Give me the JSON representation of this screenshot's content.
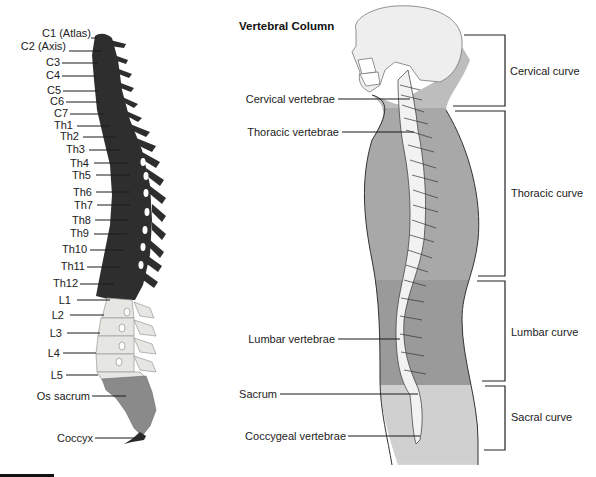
{
  "title": "Vertebral Column",
  "left_panel": {
    "labels": [
      {
        "text": "C1 (Atlas)",
        "y": 33,
        "right": 91
      },
      {
        "text": "C2 (Axis)",
        "y": 46,
        "right": 66
      },
      {
        "text": "C3",
        "y": 61,
        "right": 60
      },
      {
        "text": "C4",
        "y": 74,
        "right": 60
      },
      {
        "text": "C5",
        "y": 89,
        "right": 61
      },
      {
        "text": "C6",
        "y": 100,
        "right": 64
      },
      {
        "text": "C7",
        "y": 112,
        "right": 68
      },
      {
        "text": "Th1",
        "y": 124,
        "right": 73
      },
      {
        "text": "Th2",
        "y": 135,
        "right": 79
      },
      {
        "text": "Th3",
        "y": 148,
        "right": 85
      },
      {
        "text": "Th4",
        "y": 162,
        "right": 89
      },
      {
        "text": "Th5",
        "y": 175,
        "right": 91
      },
      {
        "text": "Th6",
        "y": 191,
        "right": 92
      },
      {
        "text": "Th7",
        "y": 204,
        "right": 93
      },
      {
        "text": "Th8",
        "y": 218,
        "right": 91
      },
      {
        "text": "Th9",
        "y": 232,
        "right": 89
      },
      {
        "text": "Th10",
        "y": 248,
        "right": 87
      },
      {
        "text": "Th11",
        "y": 265,
        "right": 85
      },
      {
        "text": "Th12",
        "y": 282,
        "right": 79
      },
      {
        "text": "L1",
        "y": 298,
        "right": 71
      },
      {
        "text": "L2",
        "y": 314,
        "right": 64
      },
      {
        "text": "L3",
        "y": 332,
        "right": 62
      },
      {
        "text": "L4",
        "y": 352,
        "right": 60
      },
      {
        "text": "L5",
        "y": 374,
        "right": 63
      },
      {
        "text": "Os sacrum",
        "y": 395,
        "right": 88
      },
      {
        "text": "Coccyx",
        "y": 437,
        "right": 90
      }
    ],
    "colors": {
      "cervical_thoracic": "#2e2e2e",
      "lumbar": "#e6e6e2",
      "sacrum": "#8a8a8a"
    }
  },
  "right_panel": {
    "vertebrae_labels": [
      {
        "text": "Cervical vertebrae",
        "y": 98
      },
      {
        "text": "Thoracic vertebrae",
        "y": 131
      },
      {
        "text": "Lumbar vertebrae",
        "y": 338
      },
      {
        "text": "Sacrum",
        "y": 393
      },
      {
        "text": "Coccygeal vertebrae",
        "y": 435
      }
    ],
    "curves": [
      {
        "label": "Cervical curve",
        "top": 35,
        "bottom": 106
      },
      {
        "label": "Thoracic curve",
        "top": 111,
        "bottom": 276
      },
      {
        "label": "Lumbar curve",
        "top": 281,
        "bottom": 381
      },
      {
        "label": "Sacral curve",
        "top": 386,
        "bottom": 450
      }
    ],
    "colors": {
      "cervical_band": "#b8b8b8",
      "thoracic_band": "#a6a6a6",
      "lumbar_band": "#999999",
      "sacral_band": "#cfcfcf",
      "outline": "#333333"
    }
  }
}
